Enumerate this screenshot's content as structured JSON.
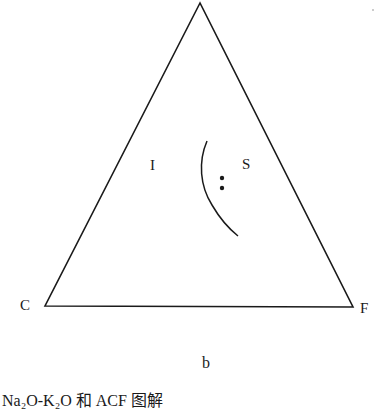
{
  "diagram": {
    "vertices": {
      "top": {
        "label": ""
      },
      "left": {
        "label": "C"
      },
      "right": {
        "label": "F"
      }
    },
    "regions": [
      {
        "label": "I"
      },
      {
        "label": "S"
      }
    ],
    "points": [
      {
        "x": 222,
        "y": 178
      },
      {
        "x": 222,
        "y": 188
      }
    ],
    "sublabel": "b",
    "colors": {
      "line": "#1a1a1a",
      "background": "#ffffff"
    }
  },
  "caption": "Na₂O-K₂O 和 ACF 图解"
}
